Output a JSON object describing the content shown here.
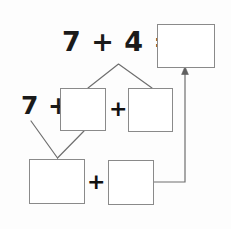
{
  "diagram": {
    "canvas": {
      "width": 231,
      "height": 229,
      "background": "#fdfdfd"
    },
    "stroke_color": "#8a8a8a",
    "text_color": "#1a1a1a",
    "expressions": {
      "top": "7 + 4 =",
      "left": "7 +",
      "plus_middle": "+",
      "plus_bottom": "+"
    },
    "boxes": [
      {
        "id": "box-sum",
        "label": "",
        "name": "answer-box-sum"
      },
      {
        "id": "box-addend-a",
        "label": "",
        "name": "answer-box-addend-a"
      },
      {
        "id": "box-addend-b",
        "label": "",
        "name": "answer-box-addend-b"
      },
      {
        "id": "box-part-a",
        "label": "",
        "name": "answer-box-part-a"
      },
      {
        "id": "box-part-b",
        "label": "",
        "name": "answer-box-part-b"
      }
    ],
    "connectors": [
      {
        "name": "branch-upper",
        "type": "inverted-v",
        "from": "7 + 4 =",
        "to": [
          "addend-a",
          "addend-b"
        ]
      },
      {
        "name": "branch-lower",
        "type": "v",
        "from": [
          "7 +",
          "addend-a"
        ],
        "to": "part-a"
      },
      {
        "name": "result-arrow",
        "type": "elbow-arrow",
        "from": "part-b",
        "to": "sum"
      }
    ]
  }
}
